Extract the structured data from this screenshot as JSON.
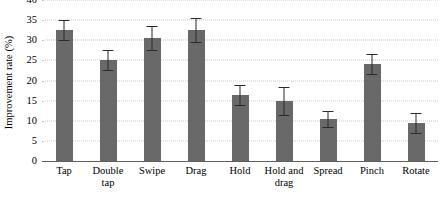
{
  "chart_data": {
    "type": "bar",
    "title": "",
    "subtitle": "",
    "xlabel": "",
    "ylabel": "Improvement rate (%)",
    "ylim": [
      0,
      40
    ],
    "yticks": [
      0,
      5,
      10,
      15,
      20,
      25,
      30,
      35,
      40
    ],
    "ytick_labels": [
      "0",
      "5",
      "10",
      "15",
      "20",
      "25",
      "30",
      "35",
      "40"
    ],
    "grid": "horizontal-dotted",
    "legend": "none",
    "bar_color": "#696969",
    "error_color": "#2b2b2b",
    "grid_color": "#c9c9c9",
    "axis_color": "#5f5f5f",
    "categories": [
      "Tap",
      "Double tap",
      "Swipe",
      "Drag",
      "Hold",
      "Hold and drag",
      "Spread",
      "Pinch",
      "Rotate"
    ],
    "category_lines": [
      [
        "Tap"
      ],
      [
        "Double",
        "tap"
      ],
      [
        "Swipe"
      ],
      [
        "Drag"
      ],
      [
        "Hold"
      ],
      [
        "Hold and",
        "drag"
      ],
      [
        "Spread"
      ],
      [
        "Pinch"
      ],
      [
        "Rotate"
      ]
    ],
    "values": [
      32.5,
      25.0,
      30.5,
      32.5,
      16.5,
      15.0,
      10.5,
      24.0,
      9.5
    ],
    "errors": [
      2.5,
      2.5,
      3.0,
      3.0,
      2.5,
      3.5,
      2.0,
      2.5,
      2.5
    ],
    "error_type": "symmetric"
  }
}
